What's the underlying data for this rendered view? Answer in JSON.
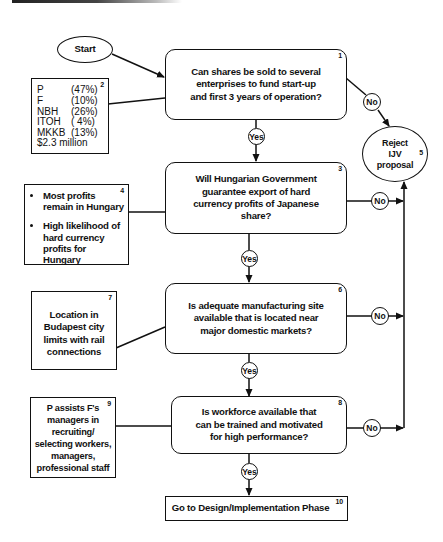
{
  "flowchart": {
    "start": {
      "label": "Start"
    },
    "nodes": [
      {
        "id": "1",
        "type": "decision",
        "number": "1",
        "text": "Can shares be sold to several enterprises to fund start-up and first 3 years of operation?"
      },
      {
        "id": "2",
        "type": "note",
        "number": "2",
        "shares": [
          {
            "party": "P",
            "pct": "(47%)"
          },
          {
            "party": "F",
            "pct": "(10%)"
          },
          {
            "party": "NBH",
            "pct": "(26%)"
          },
          {
            "party": "ITOH",
            "pct": "( 4%)"
          },
          {
            "party": "MKKB",
            "pct": "(13%)"
          }
        ],
        "total": "$2.3 million"
      },
      {
        "id": "3",
        "type": "decision",
        "number": "3",
        "text": "Will Hungarian Government guarantee export of hard currency profits of Japanese share?"
      },
      {
        "id": "4",
        "type": "note",
        "number": "4",
        "bullets": [
          "Most profits remain in Hungary",
          "High likelihood of hard currency profits for Hungary"
        ]
      },
      {
        "id": "5",
        "type": "terminal",
        "number": "5",
        "text": "Reject IJV proposal"
      },
      {
        "id": "6",
        "type": "decision",
        "number": "6",
        "text": "Is adequate manufacturing site available that is located near major domestic markets?"
      },
      {
        "id": "7",
        "type": "note",
        "number": "7",
        "text": "Location in Budapest city limits with rail connections"
      },
      {
        "id": "8",
        "type": "decision",
        "number": "8",
        "text": "Is workforce available that can be trained and motivated for high performance?"
      },
      {
        "id": "9",
        "type": "note",
        "number": "9",
        "text": "P assists F's managers in recruiting/ selecting workers, managers, professional staff"
      },
      {
        "id": "10",
        "type": "process",
        "number": "10",
        "text": "Go to Design/Implementation Phase"
      }
    ],
    "edge_labels": {
      "yes": "Yes",
      "no": "No"
    },
    "edges": [
      {
        "from": "start",
        "to": "1"
      },
      {
        "from": "1",
        "to": "3",
        "label": "Yes"
      },
      {
        "from": "1",
        "to": "5",
        "label": "No"
      },
      {
        "from": "3",
        "to": "6",
        "label": "Yes"
      },
      {
        "from": "3",
        "to": "5",
        "label": "No"
      },
      {
        "from": "6",
        "to": "8",
        "label": "Yes"
      },
      {
        "from": "6",
        "to": "5",
        "label": "No"
      },
      {
        "from": "8",
        "to": "10",
        "label": "Yes"
      },
      {
        "from": "8",
        "to": "5",
        "label": "No"
      },
      {
        "from": "2",
        "to": "1",
        "type": "annotation"
      },
      {
        "from": "4",
        "to": "3",
        "type": "annotation"
      },
      {
        "from": "7",
        "to": "6",
        "type": "annotation"
      },
      {
        "from": "9",
        "to": "8",
        "type": "annotation"
      }
    ]
  }
}
